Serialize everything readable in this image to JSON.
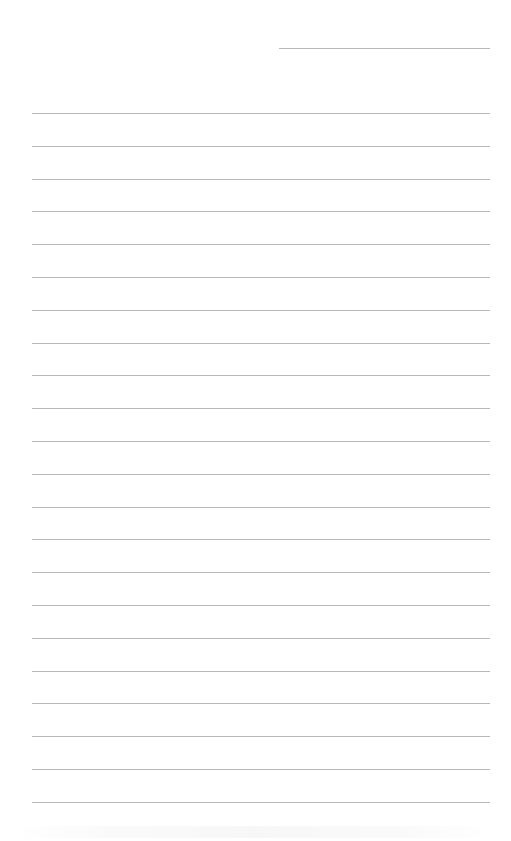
{
  "page": {
    "type": "blank ruled sheet",
    "background_color": "#ffffff",
    "line_color": "#b8b8b8"
  },
  "header_line": {
    "x_start": 279,
    "x_end": 490,
    "y": 48
  },
  "ruled_lines": {
    "count": 22,
    "x_start": 32,
    "x_end": 490,
    "first_y": 113,
    "spacing": 32.8
  }
}
